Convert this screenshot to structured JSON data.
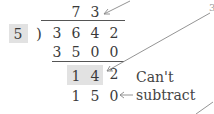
{
  "division": {
    "divisor": "5",
    "quotient": [
      "7",
      "3"
    ],
    "dividend": [
      "3",
      "6",
      "4",
      "2"
    ],
    "subtract_row": [
      "3",
      "5",
      "0",
      "0"
    ],
    "remainder_row": [
      "1",
      "4",
      "2"
    ],
    "trial_row": [
      "1",
      "5",
      "0"
    ],
    "paren": ")"
  },
  "annotations": {
    "cant_subtract_line1": "Can't",
    "cant_subtract_line2": "subtract",
    "arrow_glyph": "←",
    "edge_label_fragment": "3"
  },
  "colors": {
    "highlight": "#e2e2e2",
    "text": "#3a3a3a",
    "arrow": "#888888"
  }
}
